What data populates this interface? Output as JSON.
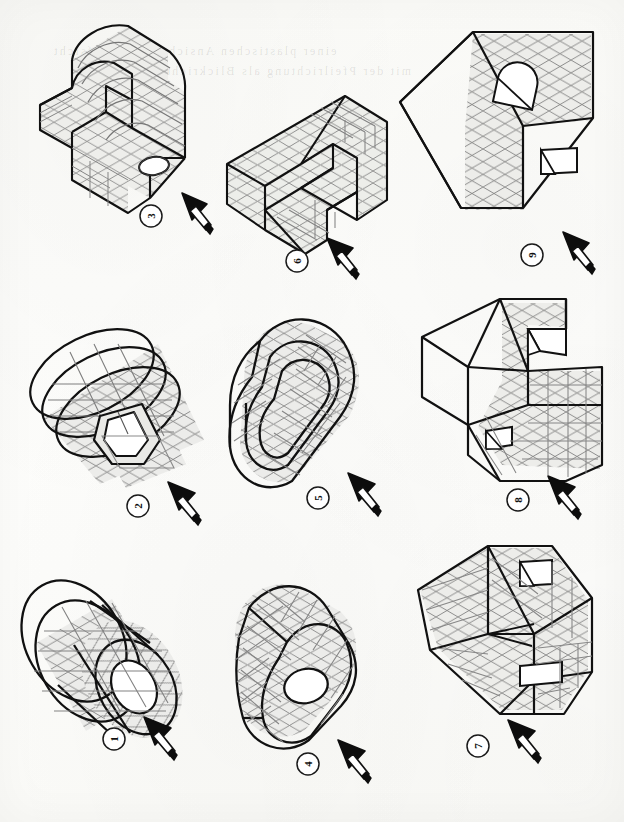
{
  "page": {
    "kind": "scanned-worksheet",
    "paper_color": "#fdfdfb",
    "ink_color": "#111111",
    "grid_color": "#7c7c7c",
    "shade_color": "#ededea",
    "ghost_color": "#3c3c3c",
    "columns": 3,
    "rows": 3
  },
  "ghost_lines": [
    {
      "text": "einer plastischen Ansicht in der Aufsicht"
    },
    {
      "text": "mit der Pfeilrichtung als Blickrichtung"
    }
  ],
  "figures": [
    {
      "id": "fig-3",
      "label": "3",
      "row": 1,
      "col": 1,
      "shape": "curved-stepped-block-with-boss-hole",
      "arrow_direction": "up-right",
      "features": [
        "curved top face",
        "step notch",
        "circular hole in flange"
      ]
    },
    {
      "id": "fig-6",
      "label": "6",
      "row": 1,
      "col": 2,
      "shape": "prism-with-vee-notch",
      "arrow_direction": "up-right",
      "features": [
        "vee-shaped notch",
        "stepped lower edge",
        "grid-hatched faces"
      ]
    },
    {
      "id": "fig-9",
      "label": "9",
      "row": 1,
      "col": 3,
      "shape": "cube-with-half-round-recess",
      "arrow_direction": "up-right",
      "features": [
        "half-round recess top",
        "rectangular slot front",
        "plain left face"
      ]
    },
    {
      "id": "fig-2",
      "label": "2",
      "row": 2,
      "col": 1,
      "shape": "stacked-discs-with-keyed-hub",
      "arrow_direction": "up-right",
      "features": [
        "three stacked elliptical discs",
        "keyway slot hub",
        "grid-hatched body"
      ]
    },
    {
      "id": "fig-5",
      "label": "5",
      "row": 2,
      "col": 2,
      "shape": "obround-channel-block",
      "arrow_direction": "up-right",
      "features": [
        "rounded-end slot",
        "channel groove",
        "grid-hatched walls"
      ]
    },
    {
      "id": "fig-8",
      "label": "8",
      "row": 2,
      "col": 3,
      "shape": "chamfered-block-with-vee-cut",
      "arrow_direction": "up-right",
      "features": [
        "angled chamfer face",
        "vee cut-out",
        "small square hole"
      ]
    },
    {
      "id": "fig-1",
      "label": "1",
      "row": 3,
      "col": 1,
      "shape": "flanged-cylindrical-bush",
      "arrow_direction": "up-right",
      "features": [
        "flange disc",
        "cylindrical body",
        "central bore"
      ]
    },
    {
      "id": "fig-4",
      "label": "4",
      "row": 3,
      "col": 2,
      "shape": "obround-block-with-bore",
      "arrow_direction": "up-right",
      "features": [
        "rounded-end prism",
        "circular bore in end face",
        "grid-hatched faces"
      ]
    },
    {
      "id": "fig-7",
      "label": "7",
      "row": 3,
      "col": 3,
      "shape": "block-with-tapered-pocket",
      "arrow_direction": "up-right",
      "features": [
        "tapered internal pocket",
        "two rectangular slots",
        "ribbed faces"
      ]
    }
  ],
  "arrow": {
    "name": "view-direction-arrow",
    "description": "solid black conical arrowhead on a shaft, indicating viewing direction",
    "head_color": "#0d0d0d",
    "shaft_color": "#ffffff"
  },
  "label_marker": {
    "name": "circled-figure-number",
    "shape": "circle",
    "rotation_degrees": -90,
    "stroke_color": "#1a1a1a"
  }
}
